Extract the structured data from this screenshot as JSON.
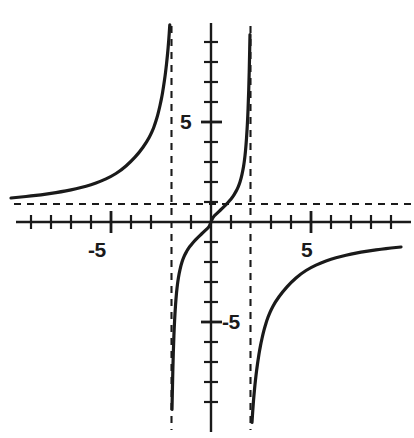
{
  "figure": {
    "kind": "function-graph",
    "background_color": "#ffffff",
    "curve_color": "#1a1a1a",
    "axis_color": "#1a1a1a",
    "asymptote_color": "#1a1a1a"
  },
  "axes": {
    "x_axis_label": "",
    "y_axis_label": "",
    "x_tick_labels": [
      "-5",
      "5"
    ],
    "y_tick_labels": [
      "5",
      "-5"
    ],
    "x_label_neg5": "-5",
    "x_label_pos5": "5",
    "y_label_pos5": "5",
    "y_label_neg5": "-5"
  },
  "chart_data": {
    "type": "line",
    "title": "",
    "subtitle": "",
    "xlabel": "",
    "ylabel": "",
    "function": "y = x^3 / (x^2 - 4)",
    "grid": false,
    "legend": null,
    "legend_position": "none",
    "xlim": [
      -10.5,
      10.2
    ],
    "ylim": [
      -11.1,
      10.1
    ],
    "x_major_ticks": [
      -5,
      5
    ],
    "x_minor_ticks": [
      -10,
      -9,
      -8,
      -7,
      -6,
      -4,
      -3,
      -2,
      -1,
      1,
      2,
      3,
      4,
      6,
      7,
      8,
      9,
      10
    ],
    "y_major_ticks": [
      5,
      -5
    ],
    "y_minor_ticks": [
      -10,
      -9,
      -8,
      -7,
      -6,
      -4,
      -3,
      -2,
      -1,
      1,
      2,
      3,
      4,
      6,
      7,
      8,
      9,
      10
    ],
    "x_tick_labels": [
      "-5",
      "5"
    ],
    "y_tick_labels": [
      "5",
      "-5"
    ],
    "vertical_asymptotes": [
      -2,
      2
    ],
    "horizontal_asymptote": 1,
    "x_intercepts": [
      0,
      2.4
    ],
    "y_intercepts": [
      0
    ],
    "annotations": [],
    "series": [
      {
        "name": "left branch",
        "x": [
          -10.5,
          -10,
          -9.5,
          -9,
          -8.5,
          -8,
          -7.5,
          -7,
          -6.5,
          -6,
          -5.5,
          -5,
          -4.5,
          -4,
          -3.6,
          -3.2,
          -3,
          -2.9,
          -2.8,
          -2.7,
          -2.6,
          -2.5,
          -2.45,
          -2.4,
          -2.35,
          -2.3,
          -2.25,
          -2.2,
          -2.16,
          -2.13,
          -2.1,
          -2.08,
          -2.06,
          -2.05
        ],
        "y": [
          1.15,
          1.2,
          1.25,
          1.3,
          1.36,
          1.43,
          1.51,
          1.6,
          1.72,
          1.86,
          2.04,
          2.27,
          2.58,
          3.02,
          3.46,
          4.02,
          4.4,
          4.63,
          4.9,
          5.22,
          5.6,
          6.05,
          6.31,
          6.6,
          6.92,
          7.27,
          7.67,
          8.12,
          8.53,
          8.87,
          9.26,
          9.55,
          9.86,
          10.02
        ],
        "style": "solid",
        "linewidth": 3.2
      },
      {
        "name": "middle branch",
        "x": [
          -1.95,
          -1.92,
          -1.9,
          -1.87,
          -1.84,
          -1.8,
          -1.75,
          -1.7,
          -1.65,
          -1.6,
          -1.5,
          -1.4,
          -1.3,
          -1.2,
          -1.1,
          -1.0,
          -0.85,
          -0.7,
          -0.55,
          -0.4,
          -0.25,
          -0.1,
          0,
          0.1,
          0.25,
          0.4,
          0.55,
          0.7,
          0.85,
          1.0,
          1.1,
          1.2,
          1.3,
          1.4,
          1.5,
          1.6,
          1.65,
          1.7,
          1.75,
          1.8,
          1.84,
          1.87,
          1.9,
          1.92,
          1.95
        ],
        "y": [
          -9.37,
          -7.89,
          -7.05,
          -6.08,
          -5.31,
          -4.54,
          -3.82,
          -3.3,
          -2.91,
          -2.61,
          -2.16,
          -1.85,
          -1.62,
          -1.44,
          -1.28,
          -1.15,
          -0.97,
          -0.81,
          -0.67,
          -0.53,
          -0.39,
          -0.25,
          0,
          0.25,
          0.39,
          0.53,
          0.67,
          0.81,
          0.97,
          1.15,
          1.28,
          1.44,
          1.62,
          1.85,
          2.16,
          2.61,
          2.91,
          3.3,
          3.82,
          4.54,
          5.31,
          6.08,
          7.05,
          7.89,
          9.37
        ],
        "style": "solid",
        "linewidth": 3.2
      },
      {
        "name": "right branch",
        "x": [
          2.05,
          2.06,
          2.08,
          2.1,
          2.13,
          2.16,
          2.2,
          2.25,
          2.3,
          2.35,
          2.4,
          2.45,
          2.5,
          2.6,
          2.7,
          2.8,
          2.9,
          3,
          3.2,
          3.6,
          4,
          4.5,
          5,
          5.5,
          6,
          6.5,
          7,
          7.5,
          8,
          8.5,
          9,
          9.5,
          10,
          10.2
        ],
        "y": [
          -10.02,
          -9.86,
          -9.55,
          -9.26,
          -8.87,
          -8.53,
          -8.12,
          -7.67,
          -7.27,
          -6.92,
          -6.6,
          -6.31,
          -6.05,
          -5.6,
          -5.22,
          -4.9,
          -4.63,
          -4.4,
          -4.02,
          -3.46,
          -3.02,
          -2.58,
          -2.27,
          -2.04,
          -1.86,
          -1.72,
          -1.6,
          -1.51,
          -1.43,
          -1.36,
          -1.3,
          -1.25,
          -1.2,
          -1.18
        ],
        "style": "solid",
        "linewidth": 3.2
      }
    ]
  }
}
